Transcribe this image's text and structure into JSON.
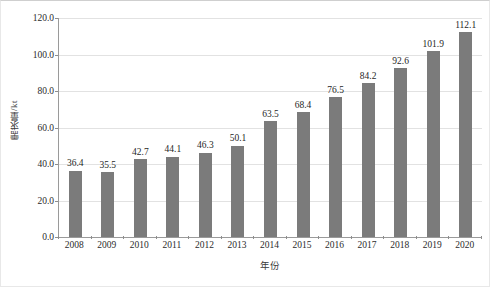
{
  "chart_data": {
    "type": "bar",
    "title": "",
    "xlabel": "年份",
    "ylabel": "需求量/kt",
    "categories": [
      "2008",
      "2009",
      "2010",
      "2011",
      "2012",
      "2013",
      "2014",
      "2015",
      "2016",
      "2017",
      "2018",
      "2019",
      "2020"
    ],
    "values": [
      36.4,
      35.5,
      42.7,
      44.1,
      46.3,
      50.1,
      63.5,
      68.4,
      76.5,
      84.2,
      92.6,
      101.9,
      112.1
    ],
    "value_labels": [
      "36.4",
      "35.5",
      "42.7",
      "44.1",
      "46.3",
      "50.1",
      "63.5",
      "68.4",
      "76.5",
      "84.2",
      "92.6",
      "101.9",
      "112.1"
    ],
    "ylim": [
      0,
      120
    ],
    "ytick_values": [
      0,
      20,
      40,
      60,
      80,
      100,
      120
    ],
    "ytick_labels": [
      "0.0",
      "20.0",
      "40.0",
      "60.0",
      "80.0",
      "100.0",
      "120.0"
    ],
    "grid": true,
    "legend": false,
    "bar_color": "#7b7b7b",
    "gridline_color": "#e2e2e2",
    "axis_color": "#9a9a9a",
    "background_color": "#ffffff"
  }
}
